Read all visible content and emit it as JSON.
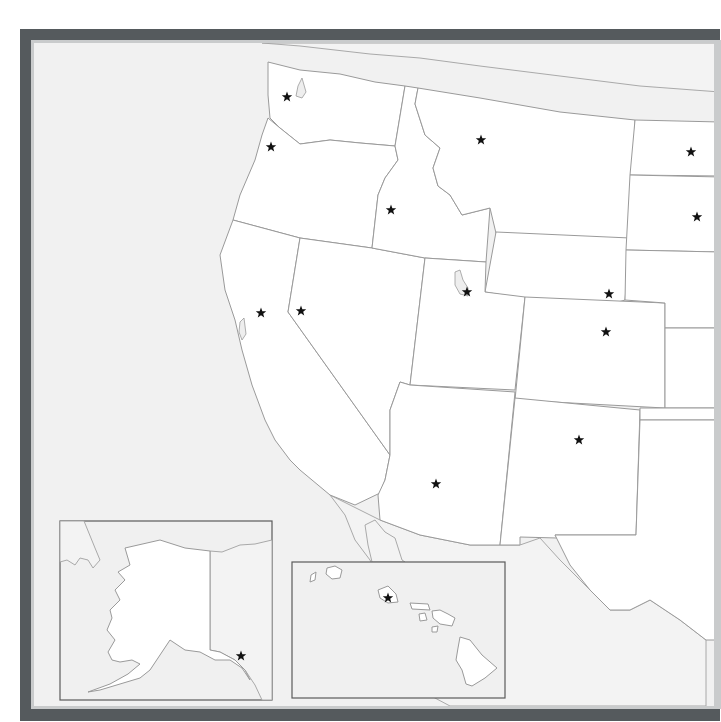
{
  "map": {
    "title": "",
    "type": "US West blank outline map with state capital stars",
    "colors": {
      "frame": "#555a5d",
      "frame_inner_edge": "#c9cbcc",
      "ocean": "#f1f1f1",
      "state_fill": "#ffffff",
      "border": "#9a9a9a",
      "star": "#111111"
    },
    "capitals": [
      {
        "state": "Washington",
        "x": 287,
        "y": 97
      },
      {
        "state": "Oregon",
        "x": 271,
        "y": 147
      },
      {
        "state": "Idaho",
        "x": 391,
        "y": 210
      },
      {
        "state": "Montana",
        "x": 481,
        "y": 140
      },
      {
        "state": "North Dakota",
        "x": 691,
        "y": 152
      },
      {
        "state": "South Dakota",
        "x": 697,
        "y": 217
      },
      {
        "state": "Wyoming",
        "x": 609,
        "y": 294
      },
      {
        "state": "Utah",
        "x": 467,
        "y": 292
      },
      {
        "state": "Colorado",
        "x": 606,
        "y": 332
      },
      {
        "state": "Nevada",
        "x": 301,
        "y": 311
      },
      {
        "state": "California",
        "x": 261,
        "y": 313
      },
      {
        "state": "Arizona",
        "x": 436,
        "y": 484
      },
      {
        "state": "New Mexico",
        "x": 579,
        "y": 440
      },
      {
        "state": "Alaska",
        "x": 241,
        "y": 656
      },
      {
        "state": "Hawaii",
        "x": 388,
        "y": 598
      }
    ],
    "insets": [
      {
        "name": "Alaska",
        "x": 60,
        "y": 521,
        "w": 212,
        "h": 179
      },
      {
        "name": "Hawaii",
        "x": 292,
        "y": 562,
        "w": 213,
        "h": 136
      }
    ]
  }
}
